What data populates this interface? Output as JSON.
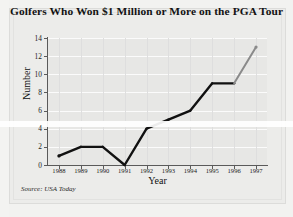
{
  "source_note": "Source: USA Today",
  "chart_data": {
    "type": "line",
    "title": "Golfers Who Won $1 Million or More on the PGA Tour",
    "xlabel": "Year",
    "ylabel": "Number",
    "categories": [
      "1988",
      "1989",
      "1990",
      "1991",
      "1992",
      "1993",
      "1994",
      "1995",
      "1996",
      "1997"
    ],
    "values": [
      1,
      2,
      2,
      0,
      4,
      5,
      6,
      9,
      9,
      13
    ],
    "yticks": [
      0,
      2,
      4,
      6,
      8,
      10,
      12,
      14
    ],
    "ylim": [
      0,
      14
    ],
    "grid": true,
    "legend": "none",
    "series": [
      {
        "name": "Golfers winning $1 million or more",
        "values": [
          1,
          2,
          2,
          0,
          4,
          5,
          6,
          9,
          9,
          13
        ],
        "color": "#111111",
        "highlight_segment": {
          "from": "1996",
          "to": "1997",
          "color": "#8a8a8a",
          "note": "final segment drawn in gray"
        }
      }
    ],
    "colors": {
      "line": "#111111",
      "line_highlight": "#8a8a8a",
      "plot_background": "#e7e7e5",
      "gridline": "#fbfbfb",
      "axis": "#5a5a5a",
      "page_background": "#ececea",
      "text": "#131313"
    }
  }
}
